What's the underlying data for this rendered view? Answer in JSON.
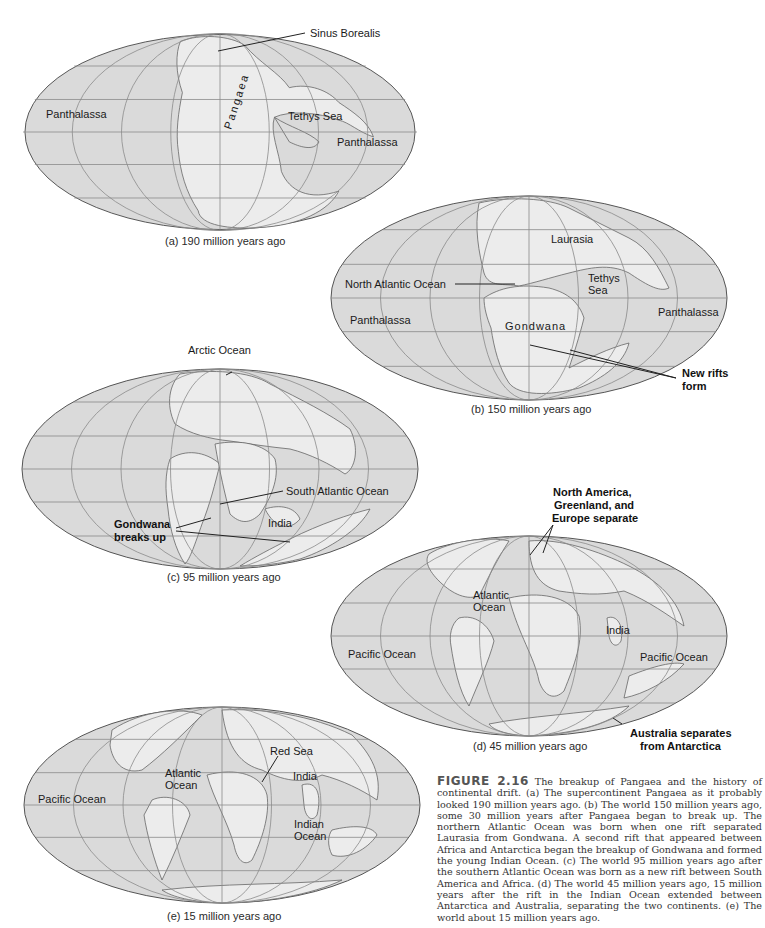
{
  "figure": {
    "number_label": "FIGURE 2.16",
    "caption": "The breakup of Pangaea and the history of continental drift. (a) The supercontinent Pangaea as it probably looked 190 million years ago. (b) The world 150 million years ago, some 30 million years after Pangaea began to break up. The northern Atlantic Ocean was born when one rift separated Laurasia from Gondwana. A second rift that appeared between Africa and Antarctica began the breakup of Gondwana and formed the young Indian Ocean. (c) The world 95 million years ago after the southern Atlantic Ocean was born as a new rift between South America and Africa. (d) The world 45 million years ago, 15 million years after the rift in the Indian Ocean extended between Antarctica and Australia, separating the two continents. (e) The world about 15 million years ago."
  },
  "maps": {
    "a": {
      "caption": "(a) 190 million years ago",
      "labels": {
        "sinus_borealis": "Sinus Borealis",
        "panthalassa_left": "Panthalassa",
        "pangaea": "Pangaea",
        "tethys_sea": "Tethys Sea",
        "panthalassa_right": "Panthalassa"
      }
    },
    "b": {
      "caption": "(b) 150 million years ago",
      "labels": {
        "laurasia": "Laurasia",
        "north_atlantic": "North Atlantic Ocean",
        "tethys_line1": "Tethys",
        "tethys_line2": "Sea",
        "panthalassa_left": "Panthalassa",
        "gondwana": "Gondwana",
        "panthalassa_right": "Panthalassa",
        "new_rifts_line1": "New rifts",
        "new_rifts_line2": "form"
      }
    },
    "c": {
      "caption": "(c) 95 million years ago",
      "labels": {
        "arctic_ocean": "Arctic Ocean",
        "south_atlantic": "South Atlantic Ocean",
        "india": "India",
        "gondwana_line1": "Gondwana",
        "gondwana_line2": "breaks up"
      }
    },
    "d": {
      "caption": "(d) 45 million years ago",
      "labels": {
        "na_sep_line1": "North America,",
        "na_sep_line2": "Greenland, and",
        "na_sep_line3": "Europe separate",
        "atlantic_line1": "Atlantic",
        "atlantic_line2": "Ocean",
        "india": "India",
        "pacific_left": "Pacific Ocean",
        "pacific_right": "Pacific Ocean",
        "aus_line1": "Australia separates",
        "aus_line2": "from Antarctica"
      }
    },
    "e": {
      "caption": "(e) 15 million years ago",
      "labels": {
        "red_sea": "Red Sea",
        "atlantic_line1": "Atlantic",
        "atlantic_line2": "Ocean",
        "india": "India",
        "pacific": "Pacific Ocean",
        "indian_line1": "Indian",
        "indian_line2": "Ocean"
      }
    }
  }
}
